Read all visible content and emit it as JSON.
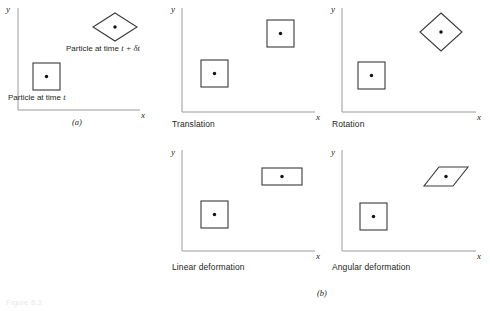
{
  "figure": {
    "panel_a_letter": "(a)",
    "panel_b_letter": "(b)",
    "axis_x": "x",
    "axis_y": "y",
    "colors": {
      "axis": "#9a9a9a",
      "shape_stroke": "#3a3a3a",
      "dot": "#111111",
      "text": "#231f20",
      "background": "#ffffff"
    },
    "bottom_cut_text": "Figure 6.3"
  },
  "panels": [
    {
      "id": "panel-a",
      "caption": "",
      "label_initial": "Particle at time ",
      "label_initial_symbol": "t",
      "label_final": "Particle at time ",
      "label_final_symbol": "t + δt",
      "initial_shape": "square",
      "final_shape": "diamond"
    },
    {
      "id": "panel-translation",
      "caption": "Translation",
      "initial_shape": "square",
      "final_shape": "square"
    },
    {
      "id": "panel-rotation",
      "caption": "Rotation",
      "initial_shape": "square",
      "final_shape": "diamond"
    },
    {
      "id": "panel-linear-deformation",
      "caption": "Linear deformation",
      "initial_shape": "square",
      "final_shape": "rectangle"
    },
    {
      "id": "panel-angular-deformation",
      "caption": "Angular deformation",
      "initial_shape": "square",
      "final_shape": "parallelogram"
    }
  ]
}
